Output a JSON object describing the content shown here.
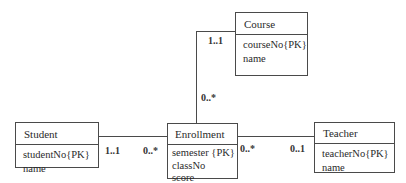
{
  "diagram": {
    "type": "UML class diagram",
    "classes": [
      {
        "id": "student",
        "name": "Student",
        "attributes": [
          "studentNo{PK}",
          "name"
        ]
      },
      {
        "id": "course",
        "name": "Course",
        "attributes": [
          "courseNo{PK}",
          "name"
        ]
      },
      {
        "id": "enrollment",
        "name": "Enrollment",
        "attributes": [
          "semester {PK}",
          "classNo",
          "score"
        ]
      },
      {
        "id": "teacher",
        "name": "Teacher",
        "attributes": [
          "teacherNo{PK}",
          "name"
        ]
      }
    ],
    "associations": [
      {
        "from": "Student",
        "to": "Enrollment",
        "from_mult": "1..1",
        "to_mult": "0..*"
      },
      {
        "from": "Course",
        "to": "Enrollment",
        "from_mult": "1..1",
        "to_mult": "0..*"
      },
      {
        "from": "Enrollment",
        "to": "Teacher",
        "from_mult": "0..*",
        "to_mult": "0..1"
      }
    ]
  }
}
